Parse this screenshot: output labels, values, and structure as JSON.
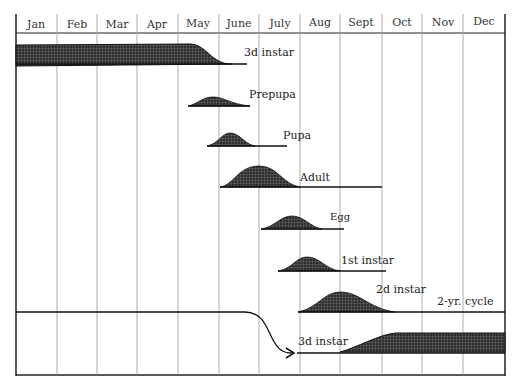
{
  "months": [
    "Jan",
    "Feb",
    "Mar",
    "Apr",
    "May",
    "June",
    "July",
    "Aug",
    "Sept",
    "Oct",
    "Nov",
    "Dec"
  ],
  "stages": [
    {
      "label": "3d instar"
    },
    {
      "label": "Prepupa"
    },
    {
      "label": "Pupa"
    },
    {
      "label": "Adult"
    },
    {
      "label": "Egg"
    },
    {
      "label": "1st instar"
    },
    {
      "label": "2d instar"
    },
    {
      "label": "2-yr. cycle"
    },
    {
      "label": "3d instar"
    }
  ],
  "colors": {
    "fill": "#3a3a3a",
    "line": "#222222",
    "grid": "#999999"
  }
}
